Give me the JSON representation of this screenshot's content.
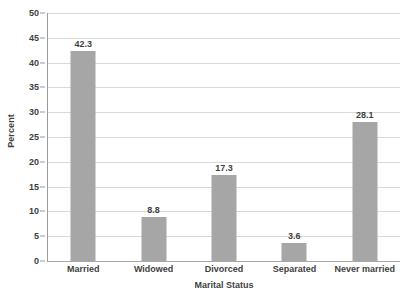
{
  "chart_data": {
    "type": "bar",
    "title": "",
    "xlabel": "Marital Status",
    "ylabel": "Percent",
    "categories": [
      "Married",
      "Widowed",
      "Divorced",
      "Separated",
      "Never married"
    ],
    "values": [
      42.3,
      8.8,
      17.3,
      3.6,
      28.1
    ],
    "value_labels": [
      "42.3",
      "8.8",
      "17.3",
      "3.6",
      "28.1"
    ],
    "ylim": [
      0,
      50
    ],
    "ytick_step": 5,
    "ytick_labels": [
      "0",
      "5",
      "10",
      "15",
      "20",
      "25",
      "30",
      "35",
      "40",
      "45",
      "50"
    ],
    "grid": "horizontal",
    "legend": "none",
    "bar_color": "#a6a6a6",
    "gridline_color": "#d9d9d9",
    "axis_color": "#9a9a9a",
    "text_color": "#3f3f3f",
    "background": "#ffffff"
  }
}
